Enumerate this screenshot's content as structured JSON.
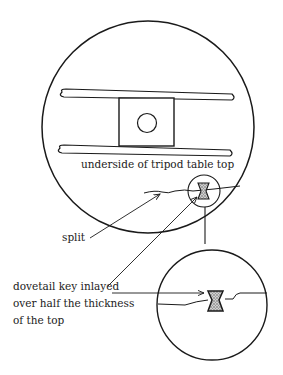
{
  "diagram": {
    "caption_top": "underside of tripod table top",
    "label_split": "split",
    "label_key_lines": [
      "dovetail key inlayed",
      "over half the thickness",
      "of the top"
    ],
    "colors": {
      "stroke": "#1a1a1a",
      "key_fill": "#9a9a9a",
      "background": "#ffffff"
    }
  }
}
